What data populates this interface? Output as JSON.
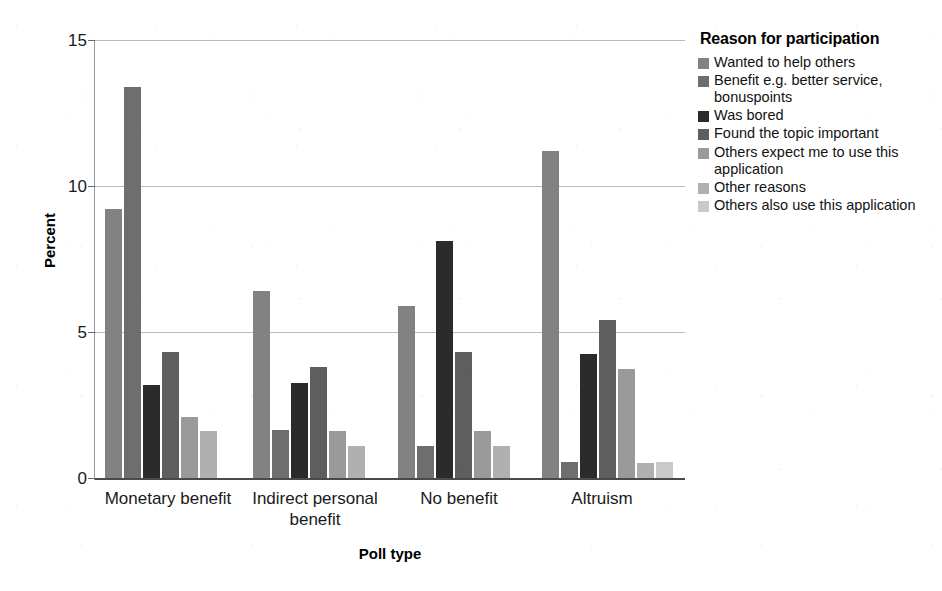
{
  "chart_data": {
    "type": "bar",
    "title": "",
    "xlabel": "Poll type",
    "ylabel": "Percent",
    "ylim": [
      0,
      15
    ],
    "yticks": [
      0,
      5,
      10,
      15
    ],
    "grid": true,
    "legend_position": "right",
    "legend_title": "Reason for participation",
    "categories": [
      "Monetary benefit",
      "Indirect personal benefit",
      "No benefit",
      "Altruism"
    ],
    "series": [
      {
        "name": "Wanted to help others",
        "color": "#828282",
        "values": [
          9.2,
          6.4,
          5.9,
          11.2
        ]
      },
      {
        "name": "Benefit e.g. better service, bonuspoints",
        "color": "#6e6e6e",
        "values": [
          13.4,
          1.65,
          1.1,
          0.55
        ]
      },
      {
        "name": "Was bored",
        "color": "#2b2b2b",
        "values": [
          3.2,
          3.25,
          8.1,
          4.25
        ]
      },
      {
        "name": "Found the topic important",
        "color": "#5e5e5e",
        "values": [
          4.3,
          3.8,
          4.3,
          5.4
        ]
      },
      {
        "name": "Others expect me to use this application",
        "color": "#9a9a9a",
        "values": [
          2.1,
          1.6,
          1.6,
          3.75
        ]
      },
      {
        "name": "Other reasons",
        "color": "#b0b0b0",
        "values": [
          1.6,
          1.1,
          1.1,
          0.5
        ]
      },
      {
        "name": "Others also use this application",
        "color": "#c9c9c9",
        "values": [
          0,
          0,
          0,
          0.55
        ]
      }
    ]
  },
  "axis": {
    "y_tick_labels": [
      "0",
      "5",
      "10",
      "15"
    ],
    "y_title": "Percent",
    "x_title": "Poll type",
    "x_tick_labels": [
      "Monetary benefit",
      "Indirect personal benefit",
      "No benefit",
      "Altruism"
    ]
  },
  "legend": {
    "title": "Reason for participation",
    "entries": [
      {
        "label": "Wanted to help others",
        "color": "#828282"
      },
      {
        "label": "Benefit e.g. better service, bonuspoints",
        "color": "#6e6e6e"
      },
      {
        "label": "Was bored",
        "color": "#2b2b2b"
      },
      {
        "label": "Found the topic important",
        "color": "#5e5e5e"
      },
      {
        "label": "Others expect me to use this application",
        "color": "#9a9a9a"
      },
      {
        "label": "Other reasons",
        "color": "#b0b0b0"
      },
      {
        "label": "Others also use this application",
        "color": "#c9c9c9"
      }
    ]
  }
}
